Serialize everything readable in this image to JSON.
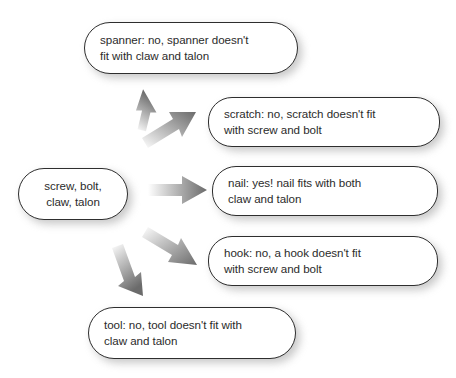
{
  "diagram": {
    "background_color": "#ffffff",
    "text_color": "#2b2b2b",
    "border_color": "#2e2e2e",
    "arrow_color_dark": "#6e6e6e",
    "arrow_color_light": "#ffffff",
    "source": {
      "name": "source-node",
      "lines": [
        "screw, bolt,",
        "claw, talon"
      ],
      "align": "center"
    },
    "branches": [
      {
        "name": "branch-spanner",
        "keyword": "spanner",
        "verdict": "no",
        "lines": [
          "spanner: no, spanner doesn't",
          "fit with claw and talon"
        ],
        "arrow": "arrow-up-steep"
      },
      {
        "name": "branch-scratch",
        "keyword": "scratch",
        "verdict": "no",
        "lines": [
          "scratch: no, scratch doesn't fit",
          "with screw and bolt"
        ],
        "arrow": "arrow-up-shallow"
      },
      {
        "name": "branch-nail",
        "keyword": "nail",
        "verdict": "yes",
        "lines": [
          "nail: yes! nail fits with both",
          "claw and talon"
        ],
        "arrow": "arrow-right"
      },
      {
        "name": "branch-hook",
        "keyword": "hook",
        "verdict": "no",
        "lines": [
          "hook: no, a hook doesn't fit",
          "with screw and bolt"
        ],
        "arrow": "arrow-down-shallow"
      },
      {
        "name": "branch-tool",
        "keyword": "tool",
        "verdict": "no",
        "lines": [
          "tool: no, tool doesn't fit with",
          "claw and talon"
        ],
        "arrow": "arrow-down-steep"
      }
    ]
  }
}
